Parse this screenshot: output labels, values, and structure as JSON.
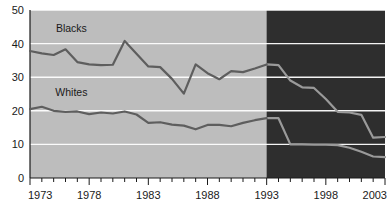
{
  "chart_data": {
    "type": "line",
    "title": "",
    "subtitle": "",
    "xlabel": "",
    "ylabel": "",
    "xlim": [
      1973,
      2003
    ],
    "ylim": [
      0,
      50
    ],
    "yticks": [
      0,
      10,
      20,
      30,
      40,
      50
    ],
    "ytick_labels": [
      "0",
      "10",
      "20",
      "30",
      "40",
      "50"
    ],
    "xticks": [
      1973,
      1978,
      1983,
      1988,
      1993,
      1998,
      2003
    ],
    "xtick_labels": [
      "1973",
      "1978",
      "1983",
      "1988",
      "1993",
      "1998",
      "2003"
    ],
    "minor_xticks_every": 1,
    "grid": "horizontal",
    "grid_color": "#ffffff",
    "legend_position": "inline-annotations",
    "shaded_region": {
      "label": "",
      "x_start": 1993,
      "x_end": 2003,
      "color": "#2e2e2e"
    },
    "plot_bg_color": "#bdbdbd",
    "series": [
      {
        "name": "Blacks",
        "color": "#5e5e5e",
        "projected_color": "#9a9a9a",
        "label": "Blacks",
        "x": [
          1973,
          1974,
          1975,
          1976,
          1977,
          1978,
          1979,
          1980,
          1981,
          1982,
          1983,
          1984,
          1985,
          1986,
          1987,
          1988,
          1989,
          1990,
          1991,
          1992,
          1993,
          1994,
          1995,
          1996,
          1997,
          1998,
          1999,
          2000,
          2001,
          2002,
          2003
        ],
        "values": [
          37.8,
          37.1,
          36.6,
          38.3,
          34.5,
          33.8,
          33.6,
          33.7,
          40.8,
          37.0,
          33.2,
          33.0,
          29.5,
          25.1,
          33.8,
          31.2,
          29.4,
          31.8,
          31.5,
          32.6,
          33.8,
          33.6,
          29.0,
          27.0,
          26.8,
          23.5,
          19.7,
          19.5,
          18.8,
          12.0,
          12.2
        ]
      },
      {
        "name": "Whites",
        "color": "#5e5e5e",
        "projected_color": "#9a9a9a",
        "label": "Whites",
        "x": [
          1973,
          1974,
          1975,
          1976,
          1977,
          1978,
          1979,
          1980,
          1981,
          1982,
          1983,
          1984,
          1985,
          1986,
          1987,
          1988,
          1989,
          1990,
          1991,
          1992,
          1993,
          1994,
          1995,
          1996,
          1997,
          1998,
          1999,
          2000,
          2001,
          2002,
          2003
        ],
        "values": [
          20.5,
          21.2,
          20.0,
          19.7,
          19.8,
          19.0,
          19.5,
          19.2,
          19.8,
          18.9,
          16.4,
          16.6,
          15.9,
          15.6,
          14.5,
          15.8,
          15.8,
          15.4,
          16.4,
          17.2,
          17.8,
          17.8,
          10.0,
          10.0,
          9.9,
          9.9,
          9.8,
          9.0,
          7.8,
          6.4,
          6.2
        ]
      }
    ],
    "annotations": [
      {
        "text": "Blacks",
        "x": 1976.5,
        "y": 43.5
      },
      {
        "text": "Whites",
        "x": 1976.5,
        "y": 24.5
      }
    ]
  }
}
